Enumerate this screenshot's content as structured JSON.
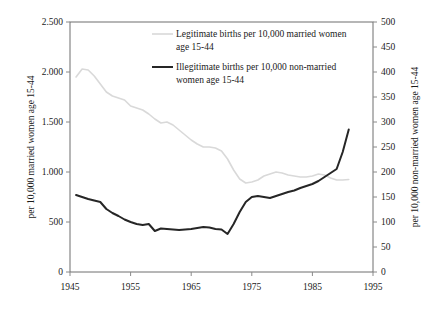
{
  "chart_data": {
    "type": "line",
    "title": "",
    "xlabel": "",
    "ylabel": "per 10,000 married women age 15-44",
    "y2label": "per 10,000 non-married women age 15-44",
    "xlim": [
      1945,
      1995
    ],
    "ylim": [
      0,
      2500
    ],
    "y2lim": [
      0,
      500
    ],
    "grid": false,
    "legend_position": "top-center",
    "x_ticks": [
      "1945",
      "1955",
      "1965",
      "1975",
      "1985",
      "1995"
    ],
    "x_tick_values": [
      1945,
      1955,
      1965,
      1975,
      1985,
      1995
    ],
    "y_ticks": [
      "0",
      "500",
      "1.000",
      "1.500",
      "2.000",
      "2.500"
    ],
    "y_tick_values": [
      0,
      500,
      1000,
      1500,
      2000,
      2500
    ],
    "y2_ticks": [
      "0",
      "50",
      "100",
      "150",
      "200",
      "250",
      "300",
      "350",
      "400",
      "450",
      "500"
    ],
    "y2_tick_values": [
      0,
      50,
      100,
      150,
      200,
      250,
      300,
      350,
      400,
      450,
      500
    ],
    "series": [
      {
        "name": "Legitimate births per 10,000 married women age 15-44",
        "axis": "left",
        "color": "#d9d9d9",
        "width": 1.6,
        "x": [
          1946,
          1947,
          1948,
          1949,
          1950,
          1951,
          1952,
          1953,
          1954,
          1955,
          1956,
          1957,
          1958,
          1959,
          1960,
          1961,
          1962,
          1963,
          1964,
          1965,
          1966,
          1967,
          1968,
          1969,
          1970,
          1971,
          1972,
          1973,
          1974,
          1975,
          1976,
          1977,
          1978,
          1979,
          1980,
          1981,
          1982,
          1983,
          1984,
          1985,
          1986,
          1987,
          1988,
          1989,
          1990,
          1991
        ],
        "y": [
          1950,
          2030,
          2020,
          1960,
          1880,
          1800,
          1760,
          1740,
          1720,
          1660,
          1640,
          1620,
          1580,
          1530,
          1490,
          1500,
          1470,
          1420,
          1370,
          1320,
          1280,
          1250,
          1250,
          1240,
          1210,
          1130,
          1020,
          930,
          890,
          900,
          920,
          960,
          980,
          1000,
          990,
          970,
          960,
          950,
          950,
          960,
          980,
          970,
          940,
          920,
          920,
          925
        ]
      },
      {
        "name": "Illegitimate births per 10,000 non-married women age 15-44",
        "axis": "right",
        "color": "#262626",
        "width": 2.0,
        "x": [
          1946,
          1947,
          1948,
          1949,
          1950,
          1951,
          1952,
          1953,
          1954,
          1955,
          1956,
          1957,
          1958,
          1959,
          1960,
          1961,
          1962,
          1963,
          1964,
          1965,
          1966,
          1967,
          1968,
          1969,
          1970,
          1971,
          1972,
          1973,
          1974,
          1975,
          1976,
          1977,
          1978,
          1979,
          1980,
          1981,
          1982,
          1983,
          1984,
          1985,
          1986,
          1987,
          1988,
          1989,
          1990,
          1991
        ],
        "y": [
          154,
          150,
          146,
          143,
          140,
          126,
          118,
          112,
          105,
          100,
          96,
          94,
          96,
          82,
          87,
          86,
          85,
          84,
          85,
          86,
          88,
          90,
          89,
          86,
          85,
          76,
          96,
          120,
          140,
          150,
          152,
          150,
          148,
          152,
          156,
          160,
          163,
          168,
          172,
          176,
          182,
          190,
          198,
          206,
          240,
          285
        ]
      }
    ]
  },
  "legend": {
    "entries": [
      {
        "label_line1": "Legitimate births per 10,000 married women",
        "label_line2": "age 15-44"
      },
      {
        "label_line1": "Illegitimate births per 10,000 non-married",
        "label_line2": "women age 15-44"
      }
    ]
  }
}
